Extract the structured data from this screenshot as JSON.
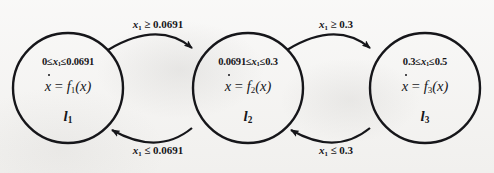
{
  "diagram": {
    "type": "hybrid-automaton-state-transition",
    "title": "",
    "background_color": "#f2f1ef",
    "stroke_color": "#16161a",
    "states": [
      {
        "id": "l1",
        "invariant": "0 ≤ x1 ≤ 0.0691",
        "invariant_parts": {
          "lower": "0",
          "lower_rel": "≤",
          "var": "x",
          "var_sub": "1",
          "upper_rel": "≤",
          "upper": "0.0691"
        },
        "flow_lhs": "x",
        "flow_lhs_sub": "",
        "flow_rel": "=",
        "flow_rhs_fn": "f",
        "flow_rhs_sub": "1",
        "flow_rhs_arg": "(x)",
        "label": "l",
        "label_sub": "1",
        "cx": 68,
        "cy": 88,
        "r": 55
      },
      {
        "id": "l2",
        "invariant": "0.0691 ≤ x1 ≤ 0.3",
        "invariant_parts": {
          "lower": "0.0691",
          "lower_rel": "≤",
          "var": "x",
          "var_sub": "1",
          "upper_rel": "≤",
          "upper": "0.3"
        },
        "flow_lhs": "x",
        "flow_lhs_sub": "",
        "flow_rel": "=",
        "flow_rhs_fn": "f",
        "flow_rhs_sub": "2",
        "flow_rhs_arg": "(x)",
        "label": "l",
        "label_sub": "2",
        "cx": 248,
        "cy": 88,
        "r": 55
      },
      {
        "id": "l3",
        "invariant": "0.3 ≤ x1 ≤ 0.5",
        "invariant_parts": {
          "lower": "0.3",
          "lower_rel": "≤",
          "var": "x",
          "var_sub": "1",
          "upper_rel": "≤",
          "upper": "0.5"
        },
        "flow_lhs": "x",
        "flow_lhs_sub": "",
        "flow_rel": "=",
        "flow_rhs_fn": "f",
        "flow_rhs_sub": "3",
        "flow_rhs_arg": "(x)",
        "label": "l",
        "label_sub": "3",
        "cx": 425,
        "cy": 88,
        "r": 55
      }
    ],
    "transitions": [
      {
        "id": "t-l1-l2",
        "from": "l1",
        "to": "l2",
        "position": "top",
        "guard_var": "x",
        "guard_var_sub": "1",
        "guard_rel": "≥",
        "guard_value": "0.0691",
        "label": "x1 ≥ 0.0691",
        "label_x": 158,
        "label_y": 18
      },
      {
        "id": "t-l2-l1",
        "from": "l2",
        "to": "l1",
        "position": "bottom",
        "guard_var": "x",
        "guard_var_sub": "1",
        "guard_rel": "≤",
        "guard_value": "0.0691",
        "label": "x1 ≤ 0.0691",
        "label_x": 158,
        "label_y": 144
      },
      {
        "id": "t-l2-l3",
        "from": "l2",
        "to": "l3",
        "position": "top",
        "guard_var": "x",
        "guard_var_sub": "1",
        "guard_rel": "≥",
        "guard_value": "0.3",
        "label": "x1 ≥ 0.3",
        "label_x": 336,
        "label_y": 18
      },
      {
        "id": "t-l3-l2",
        "from": "l3",
        "to": "l2",
        "position": "bottom",
        "guard_var": "x",
        "guard_var_sub": "1",
        "guard_rel": "≤",
        "guard_value": "0.3",
        "label": "x1 ≤ 0.3",
        "label_x": 336,
        "label_y": 144
      }
    ]
  }
}
